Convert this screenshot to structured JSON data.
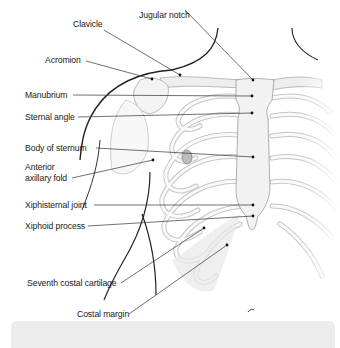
{
  "figure": {
    "labels": [
      {
        "id": "clavicle",
        "text": "Clavicle",
        "x": 74,
        "y": 22
      },
      {
        "id": "jugular-notch",
        "text": "Jugular notch",
        "x": 139,
        "y": 9
      },
      {
        "id": "acromion",
        "text": "Acromion",
        "x": 45,
        "y": 54
      },
      {
        "id": "manubrium",
        "text": "Manubrium",
        "x": 25,
        "y": 89
      },
      {
        "id": "sternal-angle",
        "text": "Sternal angle",
        "x": 25,
        "y": 112
      },
      {
        "id": "body-of-sternum",
        "text": "Body of sternum",
        "x": 25,
        "y": 143
      },
      {
        "id": "anterior-axillary-fold",
        "text": "Anterior\naxillary fold",
        "x": 25,
        "y": 160
      },
      {
        "id": "xiphisternal-joint",
        "text": "Xiphisternal joint",
        "x": 25,
        "y": 200
      },
      {
        "id": "xiphoid-process",
        "text": "Xiphoid process",
        "x": 25,
        "y": 220
      },
      {
        "id": "seventh-costal-cartilage",
        "text": "Seventh costal cartilage",
        "x": 27,
        "y": 277
      },
      {
        "id": "costal-margin",
        "text": "Costal margin",
        "x": 77,
        "y": 310
      }
    ]
  },
  "caption_bar": {
    "color": "#ececec"
  }
}
